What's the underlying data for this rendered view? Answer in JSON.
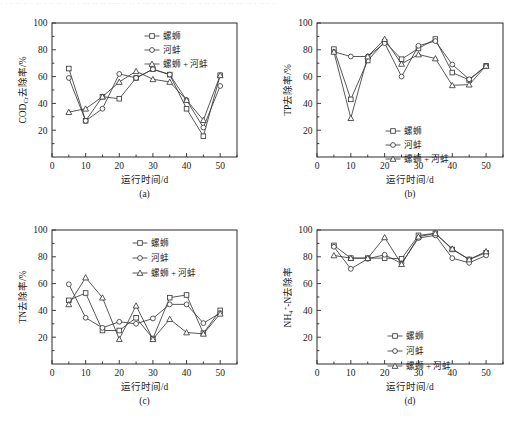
{
  "figure": {
    "top_scan_artifact": "· · ·  ·· ·· · ·· ·  ·· ·· ·  ·· · ··· ·· ··  ···· ·· ·· ·  ··· · ·· ·· · ···  ·· ·· ·· · ··· ·· ··· ·· ·  ···· ·",
    "panels": [
      "a",
      "b",
      "c",
      "d"
    ]
  },
  "legend": {
    "entries": [
      {
        "label": "螺蛳",
        "marker": "square"
      },
      {
        "label": "河蚌",
        "marker": "circle"
      },
      {
        "label": "螺蛳 + 河蚌",
        "marker": "triangle"
      }
    ]
  },
  "axis": {
    "x_title": "运行时间/d",
    "x_ticks": [
      0,
      10,
      20,
      30,
      40,
      50
    ],
    "y_ticks": [
      20,
      40,
      60,
      80,
      100
    ]
  },
  "chart_data": [
    {
      "type": "line",
      "panel": "a",
      "title": "",
      "xlabel": "运行时间/d",
      "ylabel": "CODCr去除率/%",
      "ylabel_parts": {
        "base": "COD",
        "subscript": "Cr",
        "tail": "去除率/%"
      },
      "xlim": [
        0,
        55
      ],
      "ylim": [
        0,
        100
      ],
      "grid": false,
      "legend_position": "top-right",
      "x": [
        5,
        10,
        15,
        20,
        25,
        30,
        35,
        40,
        45,
        50
      ],
      "series": [
        {
          "name": "螺蛳",
          "marker": "square",
          "values": [
            66,
            27,
            45,
            43.5,
            59,
            65.5,
            61.5,
            36,
            15.5,
            61
          ]
        },
        {
          "name": "河蚌",
          "marker": "circle",
          "values": [
            59,
            27,
            36,
            62,
            59,
            65.5,
            61.5,
            42.5,
            22,
            53
          ]
        },
        {
          "name": "螺蛳 + 河蚌",
          "marker": "triangle",
          "values": [
            33.5,
            36,
            45,
            56,
            64,
            58,
            56,
            42.5,
            27.5,
            61
          ]
        }
      ]
    },
    {
      "type": "line",
      "panel": "b",
      "title": "",
      "xlabel": "运行时间/d",
      "ylabel": "TP去除率/%",
      "ylabel_parts": {
        "base": "TP",
        "subscript": "",
        "tail": "去除率/%"
      },
      "xlim": [
        0,
        55
      ],
      "ylim": [
        0,
        100
      ],
      "grid": false,
      "legend_position": "center-bottom",
      "x": [
        5,
        10,
        15,
        20,
        25,
        30,
        35,
        40,
        45,
        50
      ],
      "series": [
        {
          "name": "螺蛳",
          "marker": "square",
          "values": [
            80.5,
            43,
            72,
            86,
            73,
            81,
            88,
            63,
            57.5,
            68
          ]
        },
        {
          "name": "河蚌",
          "marker": "circle",
          "values": [
            78.5,
            75,
            75,
            85,
            60,
            83,
            86.5,
            69,
            58,
            68
          ]
        },
        {
          "name": "螺蛳 + 河蚌",
          "marker": "triangle",
          "values": [
            78.5,
            29,
            75,
            88,
            69.5,
            76.5,
            73.5,
            53.5,
            54,
            68
          ]
        }
      ]
    },
    {
      "type": "line",
      "panel": "c",
      "title": "",
      "xlabel": "运行时间/d",
      "ylabel": "TN去除率/%",
      "ylabel_parts": {
        "base": "TN",
        "subscript": "",
        "tail": "去除率/%"
      },
      "xlim": [
        0,
        55
      ],
      "ylim": [
        0,
        100
      ],
      "grid": false,
      "legend_position": "top-center",
      "x": [
        5,
        10,
        15,
        20,
        25,
        30,
        35,
        40,
        45,
        50
      ],
      "series": [
        {
          "name": "螺蛳",
          "marker": "square",
          "values": [
            47.5,
            53,
            25,
            25,
            34.5,
            19,
            49.5,
            51.5,
            23,
            40
          ]
        },
        {
          "name": "河蚌",
          "marker": "circle",
          "values": [
            59.5,
            34.5,
            27,
            31.5,
            30,
            34,
            44.5,
            44.5,
            30.5,
            38
          ]
        },
        {
          "name": "螺蛳 + 河蚌",
          "marker": "triangle",
          "values": [
            44.5,
            64.5,
            49.5,
            18.5,
            43.5,
            18.5,
            33.5,
            23.5,
            22.5,
            37.5
          ]
        }
      ]
    },
    {
      "type": "line",
      "panel": "d",
      "title": "",
      "xlabel": "运行时间/d",
      "ylabel": "NH4+-N去除率",
      "ylabel_parts": {
        "base": "NH",
        "subscript": "4",
        "superscript": "+",
        "tail": "-N去除率"
      },
      "xlim": [
        0,
        55
      ],
      "ylim": [
        0,
        100
      ],
      "grid": false,
      "legend_position": "center-bottom",
      "x": [
        5,
        10,
        15,
        20,
        25,
        30,
        35,
        40,
        45,
        50
      ],
      "series": [
        {
          "name": "螺蛳",
          "marker": "square",
          "values": [
            88.5,
            79,
            79,
            79,
            78.5,
            96,
            97.5,
            85.5,
            78,
            83
          ]
        },
        {
          "name": "河蚌",
          "marker": "circle",
          "values": [
            87.5,
            71,
            78.5,
            81.5,
            75,
            94,
            96,
            79,
            75.5,
            81
          ]
        },
        {
          "name": "螺蛳 + 河蚌",
          "marker": "triangle",
          "values": [
            81,
            79,
            79,
            94.5,
            74.5,
            95,
            97.5,
            86,
            78,
            84
          ]
        }
      ]
    }
  ]
}
